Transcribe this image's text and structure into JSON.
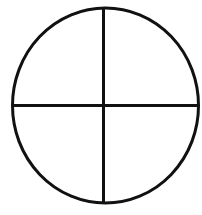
{
  "diagram": {
    "shape": "circle divided into four quadrants",
    "colors": {
      "background": "#ffffff",
      "stroke": "#111111"
    },
    "stroke_width": 3,
    "circle": {
      "cx": 105.5,
      "cy": 105.5,
      "rx": 93,
      "ry": 97.5
    },
    "vertical_line": {
      "x": 103.5,
      "y1": 8,
      "y2": 203
    },
    "horizontal_line": {
      "y": 105.5,
      "x1": 12,
      "x2": 199
    }
  }
}
